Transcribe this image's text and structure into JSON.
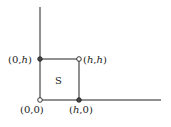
{
  "diagram": {
    "region_label": "S",
    "points": [
      {
        "id": "origin",
        "label_pre": "(0,0)",
        "x": 40,
        "y": 100
      },
      {
        "id": "top-left",
        "label_pre": "(0,",
        "label_var": "h",
        "label_post": ")",
        "x": 40,
        "y": 59
      },
      {
        "id": "top-right",
        "label_pre": "(",
        "label_var": "h",
        "label_mid": ",",
        "label_var2": "h",
        "label_post": ")",
        "x": 79,
        "y": 59
      },
      {
        "id": "bottom-right",
        "label_pre": "(",
        "label_var": "h",
        "label_post": ",0)",
        "x": 79,
        "y": 100
      }
    ],
    "colors": {
      "stroke": "#222222",
      "background": "#ffffff"
    }
  }
}
